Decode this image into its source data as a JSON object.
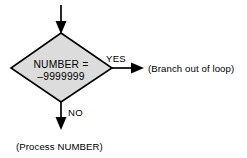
{
  "diagram": {
    "background_color": "#ffffff",
    "shape_fill_color": "#dcdcdc",
    "line_color": "#000000",
    "decision": {
      "shape": "diamond",
      "line1": "NUMBER =",
      "line2": "–9999999"
    },
    "branches": {
      "yes_label": "YES",
      "no_label": "NO"
    },
    "notes": {
      "yes_target": "(Branch out of loop)",
      "no_target": "(Process NUMBER)"
    },
    "connectors": {
      "entry_arrow": "arrow-down-into-decision",
      "yes_arrow": "arrow-right",
      "no_arrow": "arrow-down"
    }
  }
}
